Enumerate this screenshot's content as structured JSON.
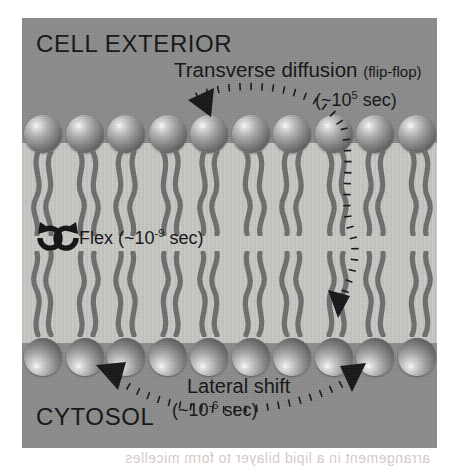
{
  "figure": {
    "type": "phospholipid-bilayer-motion-diagram",
    "compartments": {
      "top_label": "CELL EXTERIOR",
      "bottom_label": "CYTOSOL"
    },
    "annotations": {
      "transverse": {
        "title": "Transverse diffusion",
        "qualifier": "(flip-flop)",
        "timescale_prefix": "(~10",
        "timescale_exponent": "5",
        "timescale_suffix": " sec)",
        "timescale_full": "(~10^5 sec)"
      },
      "flex": {
        "title": "Flex",
        "timescale_prefix": "(~10",
        "timescale_exponent": "-9",
        "timescale_suffix": " sec)",
        "timescale_full": "Flex (~10^-9 sec)"
      },
      "lateral": {
        "title": "Lateral shift",
        "timescale_prefix": "(~10",
        "timescale_exponent": "-6",
        "timescale_suffix": " sec)",
        "timescale_full": "(~10^-6 sec)"
      }
    },
    "bilayer": {
      "upper_leaflet_count": 10,
      "lower_leaflet_count": 10,
      "tails_per_lipid": 2
    },
    "colors": {
      "panel_background": "#8c8c8c",
      "membrane_interior": "#c9c9c6",
      "head_group": "#8f8f8f",
      "tail_stroke": "#6e6e6e",
      "annotation_ink": "#141414",
      "motion_path": "#17171a"
    },
    "bleed_through_text": "arrangement in a lipid bilayer to form micelles"
  }
}
